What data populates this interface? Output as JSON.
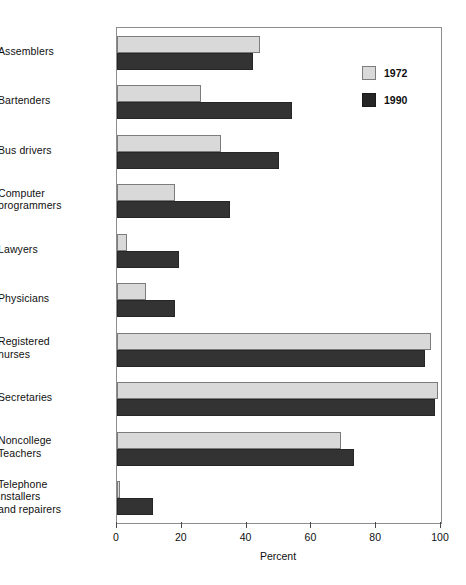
{
  "chart_data": {
    "type": "bar",
    "orientation": "horizontal",
    "title": "",
    "xlabel": "Percent",
    "ylabel": "",
    "xlim": [
      0,
      100
    ],
    "xticks": [
      0,
      20,
      40,
      60,
      80,
      100
    ],
    "grid": false,
    "legend_position": "top-right",
    "categories": [
      "Assemblers",
      "Bartenders",
      "Bus drivers",
      "Computer programmers",
      "Lawyers",
      "Physicians",
      "Registered nurses",
      "Secretaries",
      "Noncollege Teachers",
      "Telephone installers and repairers"
    ],
    "category_lines": [
      [
        "Assemblers"
      ],
      [
        "Bartenders"
      ],
      [
        "Bus drivers"
      ],
      [
        "Computer",
        "programmers"
      ],
      [
        "Lawyers"
      ],
      [
        "Physicians"
      ],
      [
        "Registered",
        "nurses"
      ],
      [
        "Secretaries"
      ],
      [
        "Noncollege",
        "Teachers"
      ],
      [
        "Telephone",
        "installers",
        "and repairers"
      ]
    ],
    "series": [
      {
        "name": "1972",
        "color": "#d9d9d9",
        "values": [
          44,
          26,
          32,
          18,
          3,
          9,
          97,
          99,
          69,
          1
        ]
      },
      {
        "name": "1990",
        "color": "#333333",
        "values": [
          42,
          54,
          50,
          35,
          19,
          18,
          95,
          98,
          73,
          11
        ]
      }
    ]
  },
  "axis": {
    "tick_labels": [
      "0",
      "20",
      "40",
      "60",
      "80",
      "100"
    ],
    "x_title": "Percent"
  },
  "legend": {
    "entries": [
      {
        "label": "1972",
        "color": "#d9d9d9"
      },
      {
        "label": "1990",
        "color": "#333333"
      }
    ]
  }
}
